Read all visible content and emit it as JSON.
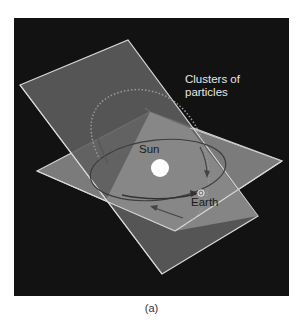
{
  "figure": {
    "labels": {
      "clusters": "Clusters of particles",
      "clusters_line1": "Clusters of",
      "clusters_line2": "particles",
      "sun": "Sun",
      "earth": "Earth"
    },
    "caption": "(a)",
    "colors": {
      "background": "#121212",
      "tilted_plane": "#6a6a6a",
      "ecliptic_plane": "#8a8a8a",
      "plane_edge": "#d8d8d8",
      "sun": "#ffffff",
      "orbit": "#3a3a3a"
    }
  }
}
